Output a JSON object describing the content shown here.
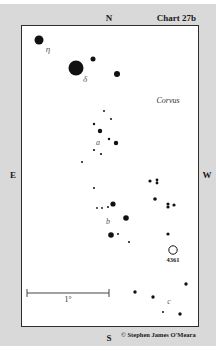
{
  "chart": {
    "title": "Chart 27b",
    "constellation": "Corvus",
    "copyright": "© Stephen James O'Meara"
  },
  "cardinals": {
    "north": "N",
    "south": "S",
    "east": "E",
    "west": "W"
  },
  "scale_bar": {
    "label": "1°",
    "x1": 27,
    "x2": 109,
    "y": 293
  },
  "stars": [
    {
      "name": "eta",
      "x": 39,
      "y": 40,
      "r": 4.5
    },
    {
      "name": "delta",
      "x": 76,
      "y": 68,
      "r": 7.5
    },
    {
      "x": 93,
      "y": 59,
      "r": 2.5
    },
    {
      "x": 117,
      "y": 74,
      "r": 3
    },
    {
      "x": 104,
      "y": 111,
      "r": 1
    },
    {
      "x": 111,
      "y": 119,
      "r": 1
    },
    {
      "x": 94,
      "y": 124,
      "r": 1.2
    },
    {
      "x": 100,
      "y": 131,
      "r": 2.2
    },
    {
      "x": 109,
      "y": 139,
      "r": 1.2
    },
    {
      "x": 116,
      "y": 143,
      "r": 2.2
    },
    {
      "x": 94,
      "y": 150,
      "r": 1.1
    },
    {
      "x": 101,
      "y": 154,
      "r": 1.1
    },
    {
      "x": 82,
      "y": 162,
      "r": 1
    },
    {
      "x": 94,
      "y": 188,
      "r": 1
    },
    {
      "x": 97,
      "y": 208,
      "r": 0.9
    },
    {
      "x": 102,
      "y": 208,
      "r": 0.9
    },
    {
      "x": 108,
      "y": 207,
      "r": 1
    },
    {
      "x": 113,
      "y": 204,
      "r": 2.6
    },
    {
      "x": 126,
      "y": 218,
      "r": 2.8
    },
    {
      "x": 111,
      "y": 235,
      "r": 2.8
    },
    {
      "x": 118,
      "y": 234,
      "r": 1
    },
    {
      "x": 129,
      "y": 242,
      "r": 1
    },
    {
      "x": 150,
      "y": 181,
      "r": 1.6
    },
    {
      "x": 157,
      "y": 180,
      "r": 1.4
    },
    {
      "x": 157,
      "y": 183,
      "r": 1.4
    },
    {
      "x": 155,
      "y": 199,
      "r": 1.8
    },
    {
      "x": 168,
      "y": 204,
      "r": 1.6
    },
    {
      "x": 168,
      "y": 207,
      "r": 1.6
    },
    {
      "x": 174,
      "y": 205,
      "r": 1.6
    },
    {
      "x": 168,
      "y": 234,
      "r": 1.6
    },
    {
      "x": 186,
      "y": 284,
      "r": 1.7
    },
    {
      "x": 135,
      "y": 292,
      "r": 1.7
    },
    {
      "x": 153,
      "y": 297,
      "r": 1.7
    },
    {
      "x": 163,
      "y": 312,
      "r": 1
    },
    {
      "x": 180,
      "y": 314,
      "r": 1.7
    }
  ],
  "greek_labels": [
    {
      "text": "η",
      "x": 48,
      "y": 49
    },
    {
      "text": "δ",
      "x": 85,
      "y": 79
    }
  ],
  "asterism_labels": [
    {
      "text": "a",
      "x": 98,
      "y": 143
    },
    {
      "text": "b",
      "x": 108,
      "y": 222
    },
    {
      "text": "c",
      "x": 169,
      "y": 302
    }
  ],
  "deep_sky": [
    {
      "id": "4361",
      "label": "4361",
      "x": 173,
      "y": 250,
      "r": 4.2,
      "label_y": 260
    }
  ],
  "colors": {
    "background": "#d9d9d9",
    "frame_border": "#2e2e2e",
    "star": "#111111"
  }
}
